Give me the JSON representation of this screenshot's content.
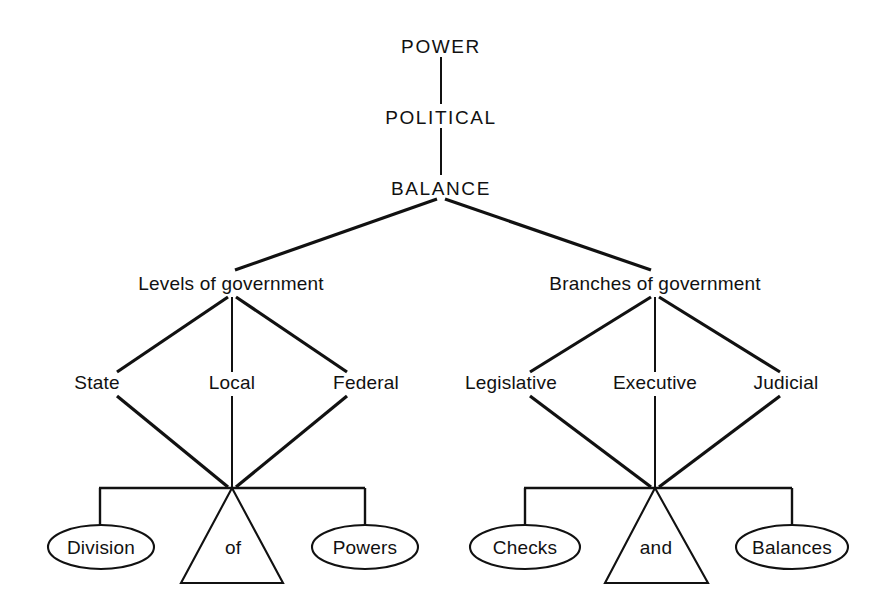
{
  "diagram": {
    "title_chain": [
      {
        "id": "power",
        "label": "POWER"
      },
      {
        "id": "political",
        "label": "POLITICAL"
      },
      {
        "id": "balance",
        "label": "BALANCE"
      }
    ],
    "groups": [
      {
        "id": "levels",
        "heading": "Levels of government",
        "children": [
          "State",
          "Local",
          "Federal"
        ],
        "scale": {
          "left_oval": "Division",
          "fulcrum": "of",
          "right_oval": "Powers"
        }
      },
      {
        "id": "branches",
        "heading": "Branches of government",
        "children": [
          "Legislative",
          "Executive",
          "Judicial"
        ],
        "scale": {
          "left_oval": "Checks",
          "fulcrum": "and",
          "right_oval": "Balances"
        }
      }
    ],
    "colors": {
      "ink": "#111111",
      "background": "#ffffff"
    }
  }
}
